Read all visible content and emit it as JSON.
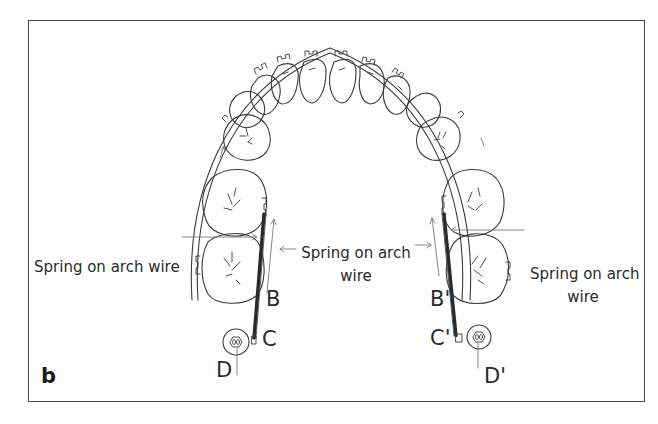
{
  "figure": {
    "panel_label": "b",
    "labels": {
      "left_spring": "Spring on arch wire",
      "center_spring_line1": "Spring on arch",
      "center_spring_line2": "wire",
      "right_spring_line1": "Spring on arch",
      "right_spring_line2": "wire"
    },
    "points": {
      "B": "B",
      "C": "C",
      "D": "D",
      "B_prime": "B'",
      "C_prime": "C'",
      "D_prime": "D'"
    },
    "colors": {
      "line": "#3a3a3a",
      "light_line": "#8a8a8a",
      "background": "#ffffff"
    }
  }
}
